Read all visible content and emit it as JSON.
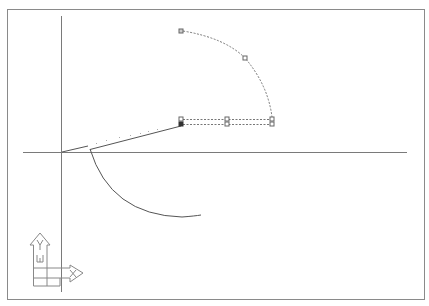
{
  "viewport": {
    "name": "CAD drawing model space",
    "background": "#ffffff",
    "frame_color": "#8a8a8a",
    "axis_color": "#7a7a7a",
    "geometry_color": "#555555",
    "grip_color": "#777777",
    "selected_grip_color": "#333333"
  },
  "ucs_icon": {
    "x_label": "X",
    "y_label": "Y",
    "w_label": "W"
  },
  "geometry": {
    "lines": [
      {
        "id": "line-origin",
        "x1": 62,
        "y1": 152,
        "x2": 88,
        "y2": 146
      },
      {
        "id": "line-to-grip",
        "x1": 90,
        "y1": 149,
        "x2": 180,
        "y2": 125
      }
    ],
    "arcs": [
      {
        "id": "arc-lower",
        "style": "solid"
      },
      {
        "id": "arc-upper-preview",
        "style": "dashed"
      }
    ],
    "grips": [
      {
        "id": "grip-arc-start",
        "x": 181,
        "y": 31
      },
      {
        "id": "grip-arc-mid",
        "x": 245,
        "y": 58
      },
      {
        "id": "grip-rect-left-top",
        "x": 181,
        "y": 119
      },
      {
        "id": "grip-rect-left-bottom",
        "x": 181,
        "y": 124,
        "selected": true
      },
      {
        "id": "grip-rect-mid-top",
        "x": 227,
        "y": 119
      },
      {
        "id": "grip-rect-mid-bottom",
        "x": 227,
        "y": 124
      },
      {
        "id": "grip-rect-right-top",
        "x": 272,
        "y": 119
      },
      {
        "id": "grip-rect-right-bottom",
        "x": 272,
        "y": 124
      }
    ]
  }
}
